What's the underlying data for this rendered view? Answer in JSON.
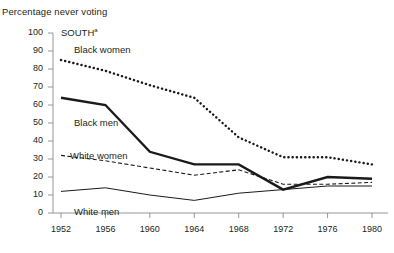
{
  "chart_data": {
    "type": "line",
    "title": "Percentage never voting",
    "panel_title": "SOUTH",
    "panel_title_footnote": "a",
    "xlabel": "",
    "ylabel": "Percentage never voting",
    "categories": [
      "1952",
      "1956",
      "1960",
      "1964",
      "1968",
      "1972",
      "1976",
      "1980"
    ],
    "x": [
      1952,
      1956,
      1960,
      1964,
      1968,
      1972,
      1976,
      1980
    ],
    "ylim": [
      0,
      100
    ],
    "yticks": [
      "0",
      "10",
      "20",
      "30",
      "40",
      "50",
      "60",
      "70",
      "80",
      "90",
      "100"
    ],
    "ytick_values": [
      0,
      10,
      20,
      30,
      40,
      50,
      60,
      70,
      80,
      90,
      100
    ],
    "grid": false,
    "legend_position": "inline-labels",
    "series": [
      {
        "name": "Black women",
        "style": "thick-dotted",
        "values": [
          85,
          79,
          71,
          64,
          42,
          31,
          31,
          27
        ]
      },
      {
        "name": "Black men",
        "style": "thick-solid",
        "values": [
          64,
          60,
          34,
          27,
          27,
          13,
          20,
          19
        ]
      },
      {
        "name": "White women",
        "style": "thin-dashed",
        "values": [
          32,
          29,
          25,
          21,
          24,
          16,
          16,
          17
        ]
      },
      {
        "name": "White men",
        "style": "thin-solid",
        "values": [
          12,
          14,
          10,
          7,
          11,
          13,
          15,
          15
        ]
      }
    ],
    "colors": {
      "line": "#1a1a1a",
      "axis": "#8b8b8b",
      "text": "#231f20",
      "background": "#ffffff"
    }
  },
  "annotations": {
    "series_labels": [
      {
        "text": "Black women",
        "for": "Black women"
      },
      {
        "text": "Black men",
        "for": "Black men"
      },
      {
        "text": "White women",
        "for": "White women"
      },
      {
        "text": "White men",
        "for": "White men"
      }
    ]
  }
}
